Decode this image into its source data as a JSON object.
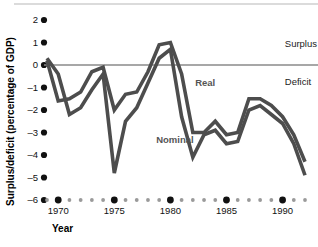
{
  "chart_data": {
    "type": "line",
    "title": "",
    "xlabel": "Year",
    "ylabel": "Surplus/deficit (percentage of GDP)",
    "xlim": [
      1969,
      1992
    ],
    "ylim": [
      -6,
      2
    ],
    "grid": false,
    "zero_line": 0,
    "legend_position": "inline-annotations",
    "y_ticks": [
      "2",
      "1",
      "0",
      "–1",
      "–2",
      "–3",
      "–4",
      "–5",
      "–6"
    ],
    "y_tick_values": [
      2,
      1,
      0,
      -1,
      -2,
      -3,
      -4,
      -5,
      -6
    ],
    "x_major_ticks": [
      "1970",
      "1975",
      "1980",
      "1985",
      "1990"
    ],
    "x_major_values": [
      1970,
      1975,
      1980,
      1985,
      1990
    ],
    "x_minor_values": [
      1969,
      1971,
      1972,
      1973,
      1974,
      1976,
      1977,
      1978,
      1979,
      1981,
      1982,
      1983,
      1984,
      1986,
      1987,
      1988,
      1989,
      1991,
      1992
    ],
    "annotations": [
      {
        "name": "surplus",
        "text": "Surplus",
        "x": 1990.2,
        "y": 0.95
      },
      {
        "name": "deficit",
        "text": "Deficit",
        "x": 1990.2,
        "y": -0.75
      },
      {
        "name": "real",
        "text": "Real",
        "x": 1983.1,
        "y": -0.8
      },
      {
        "name": "nominal",
        "text": "Nominal",
        "x": 1980.4,
        "y": -3.3
      }
    ],
    "series": [
      {
        "name": "Real",
        "color": "#4d4d4d",
        "x": [
          1969,
          1970,
          1971,
          1972,
          1973,
          1974,
          1975,
          1976,
          1977,
          1978,
          1979,
          1980,
          1981,
          1982,
          1983,
          1984,
          1985,
          1986,
          1987,
          1988,
          1989,
          1990,
          1991,
          1992
        ],
        "values": [
          0.2,
          -1.6,
          -1.5,
          -1.2,
          -0.3,
          -0.1,
          -2.0,
          -1.3,
          -1.2,
          -0.3,
          0.9,
          1.0,
          -0.4,
          -3.0,
          -3.0,
          -2.5,
          -3.1,
          -3.0,
          -1.5,
          -1.5,
          -1.8,
          -2.3,
          -3.1,
          -4.3
        ]
      },
      {
        "name": "Nominal",
        "color": "#4d4d4d",
        "x": [
          1969,
          1970,
          1971,
          1972,
          1973,
          1974,
          1975,
          1976,
          1977,
          1978,
          1979,
          1980,
          1981,
          1982,
          1983,
          1984,
          1985,
          1986,
          1987,
          1988,
          1989,
          1990,
          1991,
          1992
        ],
        "values": [
          0.3,
          -0.4,
          -2.2,
          -1.9,
          -1.1,
          -0.4,
          -4.8,
          -2.5,
          -1.9,
          -0.8,
          0.3,
          0.7,
          -2.3,
          -4.1,
          -3.1,
          -2.9,
          -3.5,
          -3.4,
          -2.0,
          -1.8,
          -2.2,
          -2.6,
          -3.5,
          -4.9
        ]
      }
    ]
  },
  "colors": {
    "line": "#4d4d4d",
    "zero_line": "#8a8a8a",
    "tick_dot": "#111111",
    "minor_dot": "#9a9a9a",
    "top_rule": "#b8b8b8"
  }
}
